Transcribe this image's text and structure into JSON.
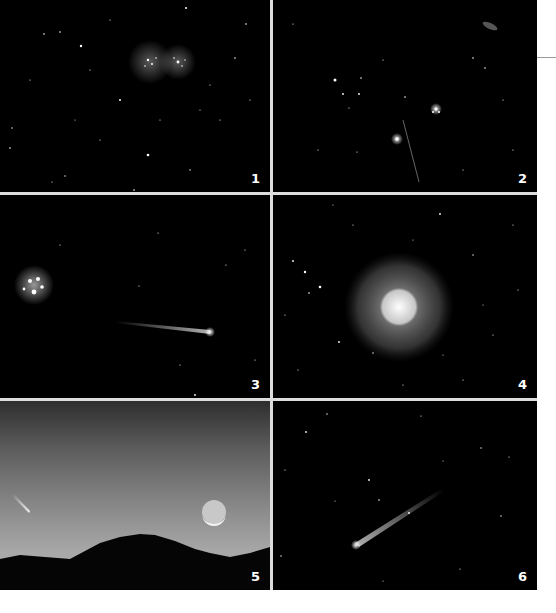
{
  "panels": [
    {
      "id": 1,
      "label": "1",
      "subject": "star-cluster-double"
    },
    {
      "id": 2,
      "label": "2",
      "subject": "star-field-with-streak"
    },
    {
      "id": 3,
      "label": "3",
      "subject": "comet-near-pleiades"
    },
    {
      "id": 4,
      "label": "4",
      "subject": "comet-glowing-coma"
    },
    {
      "id": 5,
      "label": "5",
      "subject": "comet-moon-over-mountains"
    },
    {
      "id": 6,
      "label": "6",
      "subject": "comet-with-tail"
    }
  ],
  "colors": {
    "background": "#ffffff",
    "panel": "#000000",
    "separator": "#dcdcdc",
    "label": "#ffffff"
  }
}
